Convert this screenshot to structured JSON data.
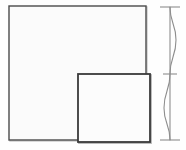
{
  "figure": {
    "title": "Overlapping squares with vertical deflection curve",
    "type": "line-drawing",
    "background_color": "#fefefe",
    "stroke_color": "#3a3a3a",
    "light_stroke_color": "#9a9a9a",
    "fill_color": "#fcfcfc",
    "canvas": {
      "width": 186,
      "height": 150
    }
  },
  "shapes": {
    "large_square": {
      "label": "large-square",
      "x": 9,
      "y": 6,
      "width": 137,
      "height": 134,
      "fill": "#fbfbfb",
      "stroke": "#4a4a4a",
      "stroke_width": 1.4
    },
    "small_square": {
      "label": "small-square",
      "x": 78,
      "y": 74,
      "width": 72,
      "height": 68,
      "fill": "#fcfcfc",
      "stroke": "#3a3a3a",
      "stroke_width": 1.8
    }
  },
  "axis": {
    "label": "vertical-reference-axis",
    "x": 170,
    "y_top": 7,
    "y_bottom": 140,
    "stroke": "#8d8d8d",
    "stroke_width": 1.1,
    "ticks": [
      {
        "name": "top-tick",
        "y": 7,
        "x_start": 160,
        "x_end": 180,
        "length": 20
      },
      {
        "name": "middle-tick",
        "y": 74,
        "x_start": 163,
        "x_end": 177,
        "length": 14
      },
      {
        "name": "bottom-tick",
        "y": 140,
        "x_start": 160,
        "x_end": 180,
        "length": 20
      }
    ]
  },
  "curve": {
    "label": "deflection-curve",
    "description": "S-shaped double-curvature deflection line, bulges right in upper half and left in lower half",
    "stroke": "#8d8d8d",
    "stroke_width": 1.1,
    "anchor_points": [
      {
        "y": 7,
        "x": 170
      },
      {
        "y": 40,
        "x": 176
      },
      {
        "y": 74,
        "x": 170
      },
      {
        "y": 108,
        "x": 164
      },
      {
        "y": 140,
        "x": 170
      }
    ],
    "max_offset_right": 6,
    "max_offset_left": 6
  },
  "shadows": {
    "large_square_shadow": {
      "offset_x": 1,
      "offset_y": 1,
      "color": "#c9c9c9"
    },
    "small_square_shadow": {
      "offset_x": 1,
      "offset_y": 1,
      "color": "#b4b4b4"
    }
  }
}
